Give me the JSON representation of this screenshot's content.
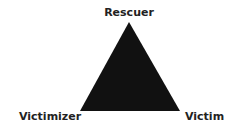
{
  "diagram": {
    "shape": "triangle",
    "fill_color": "#111111",
    "vertices": {
      "top": {
        "label": "Rescuer"
      },
      "bottom_left": {
        "label": "Victimizer"
      },
      "bottom_right": {
        "label": "Victim"
      }
    }
  }
}
